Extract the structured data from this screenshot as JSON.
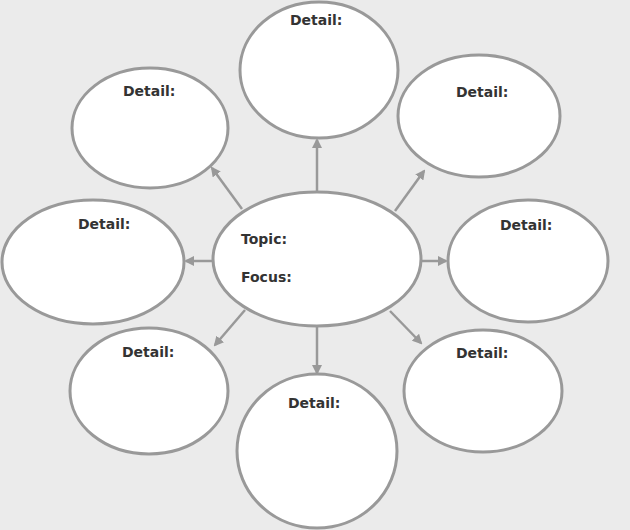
{
  "diagram": {
    "type": "cluster-web",
    "colors": {
      "background": "#ebebeb",
      "bubble_fill": "#ffffff",
      "stroke": "#999999",
      "text": "#333333"
    },
    "center": {
      "topic_label": "Topic:",
      "focus_label": "Focus:"
    },
    "details": [
      {
        "id": "top",
        "label": "Detail:"
      },
      {
        "id": "top-left",
        "label": "Detail:"
      },
      {
        "id": "top-right",
        "label": "Detail:"
      },
      {
        "id": "left",
        "label": "Detail:"
      },
      {
        "id": "right",
        "label": "Detail:"
      },
      {
        "id": "bottom-left",
        "label": "Detail:"
      },
      {
        "id": "bottom",
        "label": "Detail:"
      },
      {
        "id": "bottom-right",
        "label": "Detail:"
      }
    ]
  }
}
